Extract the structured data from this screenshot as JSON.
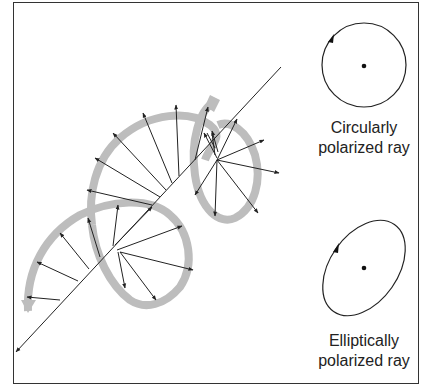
{
  "figure": {
    "circular": {
      "label_line1": "Circularly",
      "label_line2": "polarized ray"
    },
    "elliptical": {
      "label_line1": "Elliptically",
      "label_line2": "polarized ray"
    }
  },
  "colors": {
    "frame": "#333333",
    "helix_band": "#bdbdbd",
    "vector": "#222222"
  }
}
